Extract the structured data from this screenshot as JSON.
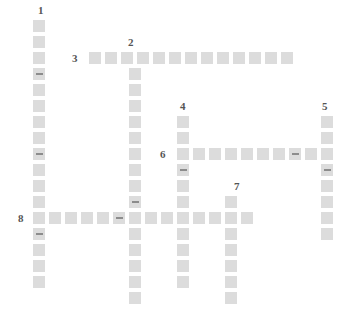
{
  "puzzle": {
    "title": "Crossword Grid",
    "cell_size": 16,
    "cell_draw": 14,
    "colors": {
      "background": "#ffffff",
      "cell": "#dcdcdc",
      "cell_border": "#ffffff",
      "dash": "#8c8c8c",
      "number": "#555555"
    },
    "numbers": [
      {
        "label": "1",
        "x": 38,
        "y": 5
      },
      {
        "label": "2",
        "x": 128,
        "y": 37
      },
      {
        "label": "3",
        "x": 72,
        "y": 53
      },
      {
        "label": "4",
        "x": 180,
        "y": 101
      },
      {
        "label": "5",
        "x": 322,
        "y": 101
      },
      {
        "label": "6",
        "x": 160,
        "y": 149
      },
      {
        "label": "7",
        "x": 234,
        "y": 181
      },
      {
        "label": "8",
        "x": 18,
        "y": 213
      }
    ],
    "entries": [
      {
        "number": "1",
        "direction": "down",
        "col_x": 32,
        "start_y": 19,
        "length": 17
      },
      {
        "number": "2",
        "direction": "down",
        "col_x": 128,
        "start_y": 51,
        "length": 16
      },
      {
        "number": "3",
        "direction": "across",
        "row_y": 51,
        "start_x": 88,
        "length": 13
      },
      {
        "number": "4",
        "direction": "down",
        "col_x": 176,
        "start_y": 115,
        "length": 12
      },
      {
        "number": "5",
        "direction": "down",
        "col_x": 320,
        "start_y": 115,
        "length": 8
      },
      {
        "number": "6",
        "direction": "across",
        "row_y": 147,
        "start_x": 176,
        "length": 9
      },
      {
        "number": "7",
        "direction": "down",
        "col_x": 224,
        "start_y": 195,
        "length": 7
      },
      {
        "number": "8",
        "direction": "across",
        "row_y": 211,
        "start_x": 32,
        "length": 15
      }
    ],
    "cells": [
      {
        "x": 32,
        "y": 19,
        "dash": false
      },
      {
        "x": 32,
        "y": 35,
        "dash": false
      },
      {
        "x": 32,
        "y": 51,
        "dash": false
      },
      {
        "x": 32,
        "y": 67,
        "dash": true
      },
      {
        "x": 32,
        "y": 83,
        "dash": false
      },
      {
        "x": 32,
        "y": 99,
        "dash": false
      },
      {
        "x": 32,
        "y": 115,
        "dash": false
      },
      {
        "x": 32,
        "y": 131,
        "dash": false
      },
      {
        "x": 32,
        "y": 147,
        "dash": true
      },
      {
        "x": 32,
        "y": 163,
        "dash": false
      },
      {
        "x": 32,
        "y": 179,
        "dash": false
      },
      {
        "x": 32,
        "y": 195,
        "dash": false
      },
      {
        "x": 32,
        "y": 211,
        "dash": false
      },
      {
        "x": 32,
        "y": 227,
        "dash": true
      },
      {
        "x": 32,
        "y": 243,
        "dash": false
      },
      {
        "x": 32,
        "y": 259,
        "dash": false
      },
      {
        "x": 32,
        "y": 275,
        "dash": false
      },
      {
        "x": 88,
        "y": 51,
        "dash": false
      },
      {
        "x": 104,
        "y": 51,
        "dash": false
      },
      {
        "x": 120,
        "y": 51,
        "dash": false
      },
      {
        "x": 136,
        "y": 51,
        "dash": false
      },
      {
        "x": 152,
        "y": 51,
        "dash": false
      },
      {
        "x": 168,
        "y": 51,
        "dash": false
      },
      {
        "x": 184,
        "y": 51,
        "dash": false
      },
      {
        "x": 200,
        "y": 51,
        "dash": false
      },
      {
        "x": 216,
        "y": 51,
        "dash": false
      },
      {
        "x": 232,
        "y": 51,
        "dash": false
      },
      {
        "x": 248,
        "y": 51,
        "dash": false
      },
      {
        "x": 264,
        "y": 51,
        "dash": false
      },
      {
        "x": 280,
        "y": 51,
        "dash": false
      },
      {
        "x": 128,
        "y": 67,
        "dash": false
      },
      {
        "x": 128,
        "y": 83,
        "dash": false
      },
      {
        "x": 128,
        "y": 99,
        "dash": false
      },
      {
        "x": 128,
        "y": 115,
        "dash": false
      },
      {
        "x": 128,
        "y": 131,
        "dash": false
      },
      {
        "x": 128,
        "y": 147,
        "dash": false
      },
      {
        "x": 128,
        "y": 163,
        "dash": false
      },
      {
        "x": 128,
        "y": 179,
        "dash": false
      },
      {
        "x": 128,
        "y": 195,
        "dash": true
      },
      {
        "x": 128,
        "y": 211,
        "dash": false
      },
      {
        "x": 128,
        "y": 227,
        "dash": false
      },
      {
        "x": 128,
        "y": 243,
        "dash": false
      },
      {
        "x": 128,
        "y": 259,
        "dash": false
      },
      {
        "x": 128,
        "y": 275,
        "dash": false
      },
      {
        "x": 128,
        "y": 291,
        "dash": false
      },
      {
        "x": 176,
        "y": 115,
        "dash": false
      },
      {
        "x": 176,
        "y": 131,
        "dash": false
      },
      {
        "x": 176,
        "y": 147,
        "dash": false
      },
      {
        "x": 176,
        "y": 163,
        "dash": true
      },
      {
        "x": 176,
        "y": 179,
        "dash": false
      },
      {
        "x": 176,
        "y": 195,
        "dash": false
      },
      {
        "x": 176,
        "y": 211,
        "dash": false
      },
      {
        "x": 176,
        "y": 227,
        "dash": false
      },
      {
        "x": 176,
        "y": 243,
        "dash": false
      },
      {
        "x": 176,
        "y": 259,
        "dash": false
      },
      {
        "x": 176,
        "y": 275,
        "dash": false
      },
      {
        "x": 320,
        "y": 115,
        "dash": false
      },
      {
        "x": 320,
        "y": 131,
        "dash": false
      },
      {
        "x": 320,
        "y": 147,
        "dash": false
      },
      {
        "x": 320,
        "y": 163,
        "dash": true
      },
      {
        "x": 320,
        "y": 179,
        "dash": false
      },
      {
        "x": 320,
        "y": 195,
        "dash": false
      },
      {
        "x": 320,
        "y": 211,
        "dash": false
      },
      {
        "x": 320,
        "y": 227,
        "dash": false
      },
      {
        "x": 192,
        "y": 147,
        "dash": false
      },
      {
        "x": 208,
        "y": 147,
        "dash": false
      },
      {
        "x": 224,
        "y": 147,
        "dash": false
      },
      {
        "x": 240,
        "y": 147,
        "dash": false
      },
      {
        "x": 256,
        "y": 147,
        "dash": false
      },
      {
        "x": 272,
        "y": 147,
        "dash": false
      },
      {
        "x": 288,
        "y": 147,
        "dash": true
      },
      {
        "x": 304,
        "y": 147,
        "dash": false
      },
      {
        "x": 224,
        "y": 195,
        "dash": false
      },
      {
        "x": 224,
        "y": 211,
        "dash": false
      },
      {
        "x": 224,
        "y": 227,
        "dash": false
      },
      {
        "x": 224,
        "y": 243,
        "dash": false
      },
      {
        "x": 224,
        "y": 259,
        "dash": false
      },
      {
        "x": 224,
        "y": 275,
        "dash": false
      },
      {
        "x": 224,
        "y": 291,
        "dash": false
      },
      {
        "x": 48,
        "y": 211,
        "dash": false
      },
      {
        "x": 64,
        "y": 211,
        "dash": false
      },
      {
        "x": 80,
        "y": 211,
        "dash": false
      },
      {
        "x": 96,
        "y": 211,
        "dash": false
      },
      {
        "x": 112,
        "y": 211,
        "dash": true
      },
      {
        "x": 144,
        "y": 211,
        "dash": false
      },
      {
        "x": 160,
        "y": 211,
        "dash": false
      },
      {
        "x": 192,
        "y": 211,
        "dash": false
      },
      {
        "x": 208,
        "y": 211,
        "dash": false
      },
      {
        "x": 240,
        "y": 211,
        "dash": false
      }
    ]
  }
}
